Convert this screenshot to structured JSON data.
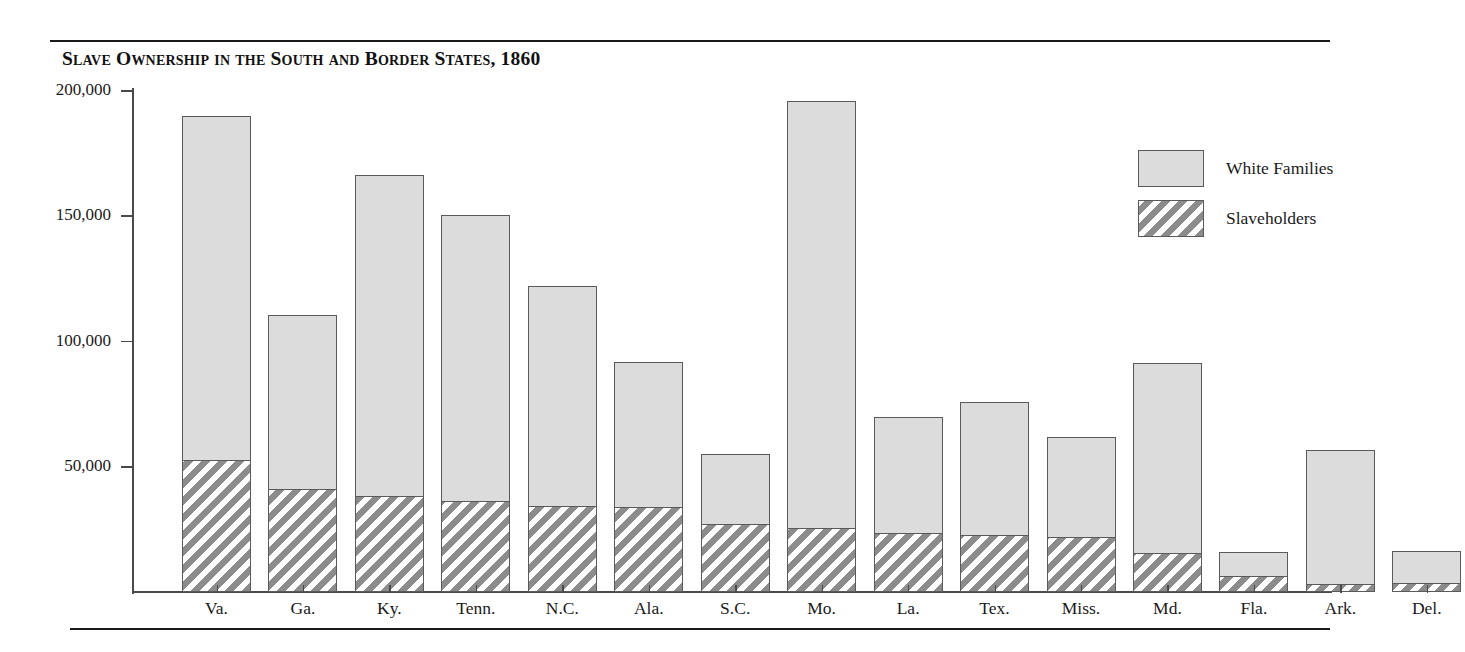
{
  "figure": {
    "title": "Slave Ownership in the South and Border States, 1860"
  },
  "legend": {
    "position": "right",
    "entries": [
      {
        "label": "White Families",
        "swatch": "solid-light-gray",
        "color": "#dcdcdc"
      },
      {
        "label": "Slaveholders",
        "swatch": "diagonal-hatch",
        "color": "#8c8c8c"
      }
    ]
  },
  "chart_data": {
    "type": "bar",
    "title": "Slave Ownership in the South and Border States, 1860",
    "xlabel": "",
    "ylabel": "",
    "ylim": [
      0,
      205000
    ],
    "grid": false,
    "legend_position": "right",
    "stacked": true,
    "note": "Slaveholders are drawn as a hatched sub-portion at the base of each White Families bar.",
    "ytick_labels": [
      "50,000",
      "100,000",
      "150,000",
      "200,000"
    ],
    "ytick_values": [
      50000,
      100000,
      150000,
      200000
    ],
    "categories": [
      "Va.",
      "Ga.",
      "Ky.",
      "Tenn.",
      "N.C.",
      "Ala.",
      "S.C.",
      "Mo.",
      "La.",
      "Tex.",
      "Miss.",
      "Md.",
      "Fla.",
      "Ark.",
      "Del."
    ],
    "series": [
      {
        "name": "White Families",
        "values": [
          190000,
          110500,
          166500,
          150500,
          122000,
          92000,
          55000,
          196000,
          70000,
          76000,
          62000,
          91500,
          16000,
          56500,
          16500
        ]
      },
      {
        "name": "Slaveholders",
        "values": [
          52500,
          41000,
          38500,
          36500,
          34500,
          33800,
          27000,
          25500,
          23500,
          22800,
          22000,
          15500,
          6400,
          3200,
          3500
        ]
      }
    ]
  }
}
